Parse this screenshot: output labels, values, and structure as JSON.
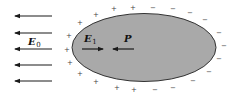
{
  "diagram": {
    "type": "physics-polarized-ellipsoid",
    "colors": {
      "background": "#ffffff",
      "ellipse_fill": "#a9a9a9",
      "ellipse_stroke": "#333333",
      "arrow": "#1a1a1a",
      "charge": "#555555"
    },
    "ellipse": {
      "cx": 144,
      "cy": 47.5,
      "rx": 72,
      "ry": 34
    },
    "external_field": {
      "label": "E",
      "subscript": "0",
      "direction": "left",
      "arrows_y": [
        16,
        33,
        49,
        65,
        81
      ],
      "x_start": 52,
      "x_end": 15
    },
    "internal_field": {
      "label": "E",
      "subscript": "1",
      "direction": "right"
    },
    "polarization": {
      "label": "P",
      "direction": "left"
    },
    "charges": {
      "plus_symbol": "+",
      "minus_symbol": "−",
      "plus_positions": [
        [
          96,
          14
        ],
        [
          114,
          8
        ],
        [
          133,
          7
        ],
        [
          80,
          22
        ],
        [
          69,
          35
        ],
        [
          67,
          49
        ],
        [
          70,
          62
        ],
        [
          80,
          73
        ],
        [
          96,
          81
        ],
        [
          117,
          87
        ],
        [
          134,
          89
        ]
      ],
      "minus_positions": [
        [
          153,
          7
        ],
        [
          173,
          8
        ],
        [
          190,
          12
        ],
        [
          205,
          19
        ],
        [
          219,
          32
        ],
        [
          224,
          45
        ],
        [
          219,
          58
        ],
        [
          209,
          71
        ],
        [
          193,
          80
        ],
        [
          173,
          87
        ],
        [
          155,
          89
        ]
      ]
    }
  }
}
